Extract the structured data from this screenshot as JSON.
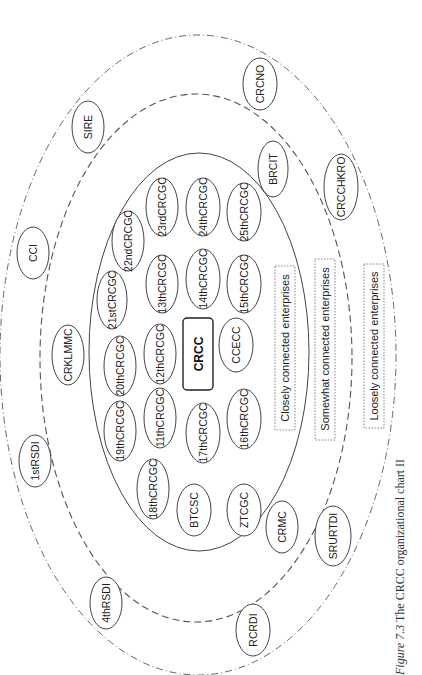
{
  "caption": {
    "figure_label": "Figure 7.3",
    "text": " The CRCC organizational chart II"
  },
  "core": {
    "label": "CRCC"
  },
  "legend": {
    "closely": "Closely connected enterprises",
    "somewhat": "Somewhat connected enterprises",
    "loosely": "Loosely connected enterprises"
  },
  "rings": {
    "inner": "closely-connected",
    "middle": "somewhat-connected",
    "outer": "loosely-connected"
  },
  "nodes": {
    "closely": [
      "22ndCRCGC",
      "23rdCRCGC",
      "24thCRCGC",
      "25thCRCGC",
      "21stCRCGC",
      "13thCRCGC",
      "14thCRCGC",
      "15thCRCGC",
      "20thCRCGC",
      "12thCRCGC",
      "CCECC",
      "19thCRCGC",
      "11thCRCGC",
      "17thCRCGC",
      "16thCRCGC",
      "18thCRCGC",
      "BTCSC",
      "ZTCGC"
    ],
    "somewhat": [
      "BRCIT",
      "CRKLMMC",
      "CRMC"
    ],
    "loosely": [
      "CRCNO",
      "SIRE",
      "CRCCHKRO",
      "CCI",
      "1stRSDI",
      "SRURTDI",
      "4thRSDI",
      "RCRDI"
    ]
  }
}
